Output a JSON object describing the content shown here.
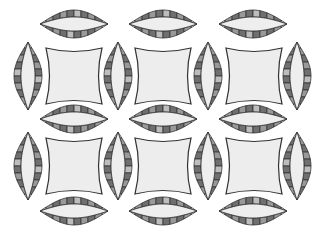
{
  "pattern": {
    "name": "double-wedding-ring",
    "width": 322,
    "height": 240,
    "colors": {
      "background": "#ffffff",
      "outline": "#333333",
      "square_fill": "#ededed",
      "lens_inner": "#eeeeee",
      "segment_dark": "#6f6f6f",
      "segment_mid": "#999999",
      "segment_light": "#bdbdbd",
      "tip": "#dedede"
    },
    "squares": [
      {
        "cx": 74,
        "cy": 76
      },
      {
        "cx": 163,
        "cy": 76
      },
      {
        "cx": 254,
        "cy": 76
      },
      {
        "cx": 74,
        "cy": 166
      },
      {
        "cx": 163,
        "cy": 166
      },
      {
        "cx": 254,
        "cy": 166
      }
    ],
    "horizontal_lenses": [
      {
        "cx": 74,
        "cy": 24
      },
      {
        "cx": 163,
        "cy": 24
      },
      {
        "cx": 253,
        "cy": 24
      },
      {
        "cx": 74,
        "cy": 119
      },
      {
        "cx": 163,
        "cy": 119
      },
      {
        "cx": 253,
        "cy": 119
      },
      {
        "cx": 74,
        "cy": 211
      },
      {
        "cx": 163,
        "cy": 211
      },
      {
        "cx": 253,
        "cy": 211
      }
    ],
    "vertical_lenses": [
      {
        "cx": 28,
        "cy": 76
      },
      {
        "cx": 118,
        "cy": 76
      },
      {
        "cx": 208,
        "cy": 76
      },
      {
        "cx": 297,
        "cy": 76
      },
      {
        "cx": 28,
        "cy": 166
      },
      {
        "cx": 118,
        "cy": 166
      },
      {
        "cx": 208,
        "cy": 166
      },
      {
        "cx": 297,
        "cy": 166
      }
    ],
    "lens": {
      "length": 68,
      "thickness": 28,
      "ring_width": 7,
      "segments": 8
    },
    "square_size": 56
  }
}
